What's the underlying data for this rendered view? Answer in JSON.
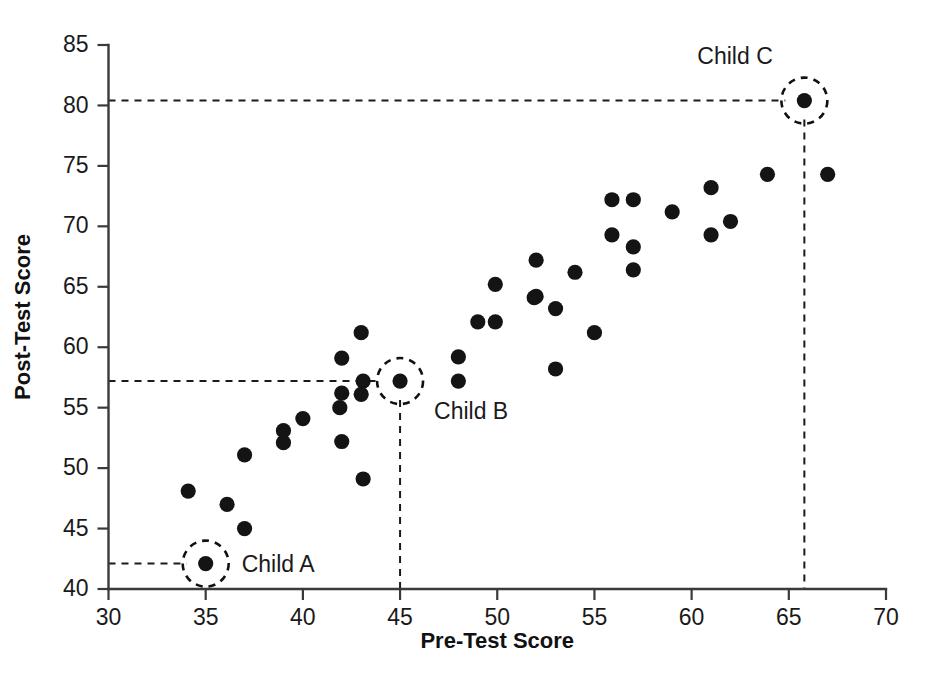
{
  "chart_data": {
    "type": "scatter",
    "title": "",
    "xlabel": "Pre-Test Score",
    "ylabel": "Post-Test Score",
    "xlim": [
      30,
      70
    ],
    "ylim": [
      40,
      85
    ],
    "xticks": [
      30,
      35,
      40,
      45,
      50,
      55,
      60,
      65,
      70
    ],
    "yticks": [
      40,
      45,
      50,
      55,
      60,
      65,
      70,
      75,
      80,
      85
    ],
    "grid": false,
    "legend": "none",
    "points": [
      {
        "x": 34.1,
        "y": 48.1
      },
      {
        "x": 36.1,
        "y": 47.0
      },
      {
        "x": 37.0,
        "y": 45.0
      },
      {
        "x": 37.0,
        "y": 51.1
      },
      {
        "x": 39.0,
        "y": 53.1
      },
      {
        "x": 39.0,
        "y": 52.1
      },
      {
        "x": 40.0,
        "y": 54.1
      },
      {
        "x": 42.0,
        "y": 52.2
      },
      {
        "x": 43.1,
        "y": 49.1
      },
      {
        "x": 42.0,
        "y": 59.1
      },
      {
        "x": 43.0,
        "y": 61.2
      },
      {
        "x": 43.1,
        "y": 57.2
      },
      {
        "x": 42.0,
        "y": 56.2
      },
      {
        "x": 43.0,
        "y": 56.1
      },
      {
        "x": 41.9,
        "y": 55.0
      },
      {
        "x": 48.0,
        "y": 59.2
      },
      {
        "x": 48.0,
        "y": 57.2
      },
      {
        "x": 49.0,
        "y": 62.1
      },
      {
        "x": 49.9,
        "y": 62.1
      },
      {
        "x": 49.9,
        "y": 65.2
      },
      {
        "x": 51.9,
        "y": 64.1
      },
      {
        "x": 52.0,
        "y": 67.2
      },
      {
        "x": 52.0,
        "y": 64.2
      },
      {
        "x": 53.0,
        "y": 63.2
      },
      {
        "x": 53.0,
        "y": 58.2
      },
      {
        "x": 54.0,
        "y": 66.2
      },
      {
        "x": 55.0,
        "y": 61.2
      },
      {
        "x": 55.9,
        "y": 72.2
      },
      {
        "x": 55.9,
        "y": 69.3
      },
      {
        "x": 57.0,
        "y": 72.2
      },
      {
        "x": 57.0,
        "y": 68.3
      },
      {
        "x": 57.0,
        "y": 66.4
      },
      {
        "x": 59.0,
        "y": 71.2
      },
      {
        "x": 61.0,
        "y": 73.2
      },
      {
        "x": 61.0,
        "y": 69.3
      },
      {
        "x": 62.0,
        "y": 70.4
      },
      {
        "x": 63.9,
        "y": 74.3
      },
      {
        "x": 67.0,
        "y": 74.3
      },
      {
        "x": 35.0,
        "y": 42.1
      },
      {
        "x": 45.0,
        "y": 57.2
      },
      {
        "x": 65.8,
        "y": 80.4
      }
    ],
    "annotations": [
      {
        "label": "Child A",
        "x": 35.0,
        "y": 42.1,
        "label_dx": 36,
        "label_dy": 0,
        "guide_x": false,
        "guide_y": true
      },
      {
        "label": "Child B",
        "x": 45.0,
        "y": 57.2,
        "label_dx": 34,
        "label_dy": 30,
        "guide_x": true,
        "guide_y": true
      },
      {
        "label": "Child C",
        "x": 65.8,
        "y": 80.4,
        "label_dx": -107,
        "label_dy": -45,
        "guide_x": true,
        "guide_y": true
      }
    ]
  },
  "colors": {
    "point": "#141414",
    "axis": "#3a3a3a",
    "text": "#1a1a1a",
    "guide": "#1a1a1a",
    "background": "#ffffff"
  }
}
